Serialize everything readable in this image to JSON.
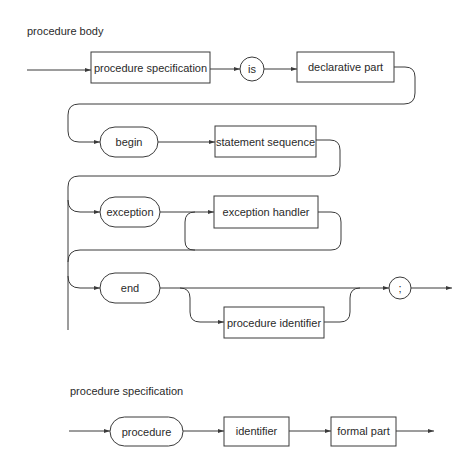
{
  "diagrams": [
    {
      "title": "procedure body",
      "nodes": {
        "procedure_specification": {
          "label": "procedure specification",
          "kind": "nonterminal"
        },
        "is": {
          "label": "is",
          "kind": "terminal-circle"
        },
        "declarative_part": {
          "label": "declarative part",
          "kind": "nonterminal"
        },
        "begin": {
          "label": "begin",
          "kind": "terminal-rounded"
        },
        "statement_sequence": {
          "label": "statement sequence",
          "kind": "nonterminal"
        },
        "exception": {
          "label": "exception",
          "kind": "terminal-rounded"
        },
        "exception_handler": {
          "label": "exception handler",
          "kind": "nonterminal"
        },
        "end": {
          "label": "end",
          "kind": "terminal-rounded"
        },
        "procedure_identifier": {
          "label": "procedure identifier",
          "kind": "nonterminal"
        },
        "semicolon": {
          "label": ";",
          "kind": "terminal-circle"
        }
      }
    },
    {
      "title": "procedure specification",
      "nodes": {
        "procedure": {
          "label": "procedure",
          "kind": "terminal-rounded"
        },
        "identifier": {
          "label": "identifier",
          "kind": "nonterminal"
        },
        "formal_part": {
          "label": "formal part",
          "kind": "nonterminal"
        }
      }
    }
  ],
  "colors": {
    "stroke": "#3a3a3a",
    "text": "#2a2a2a",
    "background": "#ffffff"
  }
}
